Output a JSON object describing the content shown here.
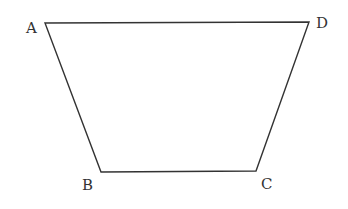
{
  "diagram": {
    "type": "trapezoid",
    "stroke_color": "#333333",
    "vertices": [
      {
        "name": "A",
        "x": 45,
        "y": 23,
        "label_x": 26,
        "label_y": 33
      },
      {
        "name": "D",
        "x": 309,
        "y": 22,
        "label_x": 316,
        "label_y": 28
      },
      {
        "name": "C",
        "x": 256,
        "y": 171,
        "label_x": 261,
        "label_y": 189
      },
      {
        "name": "B",
        "x": 101,
        "y": 172,
        "label_x": 82,
        "label_y": 190
      }
    ],
    "labels": {
      "A": "A",
      "B": "B",
      "C": "C",
      "D": "D"
    }
  }
}
